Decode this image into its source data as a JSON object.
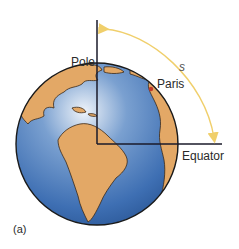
{
  "diagram": {
    "labels": {
      "pole": "Pole",
      "paris": "Paris",
      "arc": "s",
      "equator": "Equator",
      "panel": "(a)"
    },
    "colors": {
      "ocean": "#3e6fb3",
      "ocean_light": "#dde8f3",
      "land": "#e3a866",
      "arc": "#f0cf6b",
      "axis_lines": "#1a1a2a",
      "paris_marker": "#c0392b"
    }
  }
}
